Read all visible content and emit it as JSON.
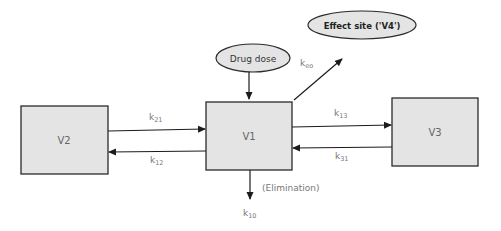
{
  "diagram": {
    "type": "pharmacokinetic-compartment-model",
    "compartments": [
      {
        "id": "V2",
        "label": "V2"
      },
      {
        "id": "V1",
        "label": "V1"
      },
      {
        "id": "V3",
        "label": "V3"
      }
    ],
    "inputs": {
      "drug_dose": "Drug dose",
      "effect_site": "Effect site ('V4')"
    },
    "rates": {
      "k21": {
        "base": "k",
        "sub": "21"
      },
      "k12": {
        "base": "k",
        "sub": "12"
      },
      "k13": {
        "base": "k",
        "sub": "13"
      },
      "k31": {
        "base": "k",
        "sub": "31"
      },
      "keo": {
        "base": "k",
        "sub": "eo"
      },
      "k10": {
        "base": "k",
        "sub": "10"
      }
    },
    "elimination_label": "(Elimination)",
    "edges": [
      {
        "from": "V2",
        "to": "V1",
        "rate": "k21"
      },
      {
        "from": "V1",
        "to": "V2",
        "rate": "k12"
      },
      {
        "from": "V1",
        "to": "V3",
        "rate": "k13"
      },
      {
        "from": "V3",
        "to": "V1",
        "rate": "k31"
      },
      {
        "from": "V1",
        "to": "Effect site",
        "rate": "keo"
      },
      {
        "from": "Drug dose",
        "to": "V1",
        "rate": ""
      },
      {
        "from": "V1",
        "to": "out",
        "rate": "k10"
      }
    ]
  }
}
